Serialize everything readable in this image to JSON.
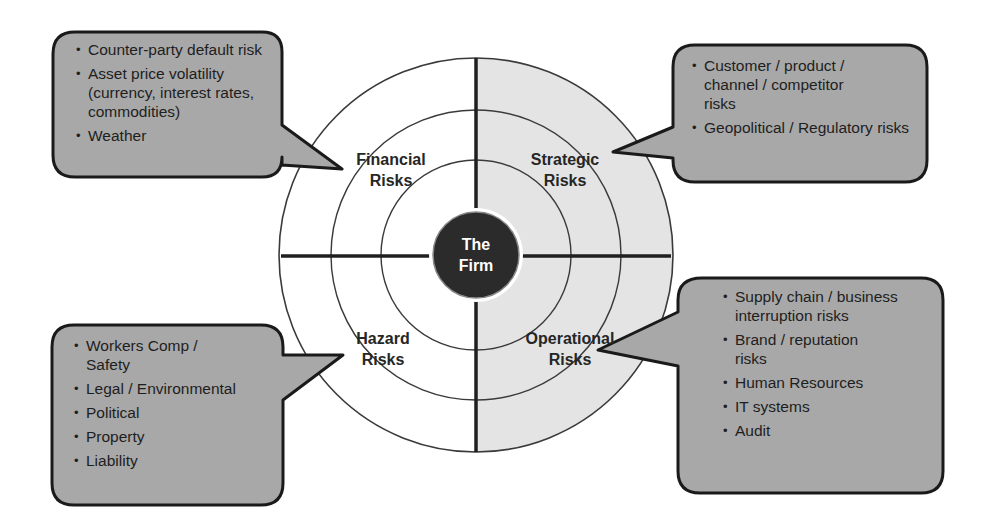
{
  "diagram": {
    "center": {
      "line1": "The",
      "line2": "Firm"
    },
    "colors": {
      "background": "#ffffff",
      "right_half_fill": "#e4e4e4",
      "callout_fill": "#a8a8a8",
      "callout_border": "#1a1a1a",
      "center_fill": "#2b2b2b",
      "center_text": "#ffffff",
      "ring_stroke": "#3a3a3a"
    },
    "quadrants": [
      {
        "id": "financial",
        "line1": "Financial",
        "line2": "Risks",
        "items": [
          "Counter-party default risk",
          "Asset price volatility (currency, interest rates, commodities)",
          "Weather"
        ]
      },
      {
        "id": "strategic",
        "line1": "Strategic",
        "line2": "Risks",
        "items": [
          "Customer / product / channel / competitor risks",
          "Geopolitical / Regulatory risks"
        ]
      },
      {
        "id": "hazard",
        "line1": "Hazard",
        "line2": "Risks",
        "items": [
          "Workers Comp / Safety",
          "Legal / Environmental",
          "Political",
          "Property",
          "Liability"
        ]
      },
      {
        "id": "operational",
        "line1": "Operational",
        "line2": "Risks",
        "items": [
          "Supply chain / business interruption risks",
          "Brand / reputation risks",
          "Human Resources",
          "IT systems",
          "Audit"
        ]
      }
    ]
  }
}
